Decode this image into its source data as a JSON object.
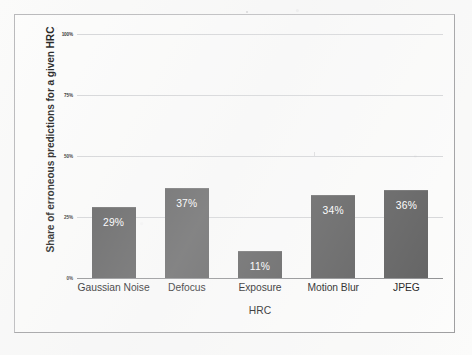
{
  "chart_data": {
    "type": "bar",
    "title": "",
    "subtitle": "",
    "xlabel": "HRC",
    "ylabel": "Share of erroneous predictions for a given HRC",
    "categories": [
      "Gaussian Noise",
      "Defocus",
      "Exposure",
      "Motion Blur",
      "JPEG"
    ],
    "values": [
      29,
      37,
      11,
      34,
      36
    ],
    "value_labels": [
      "29%",
      "37%",
      "11%",
      "34%",
      "36%"
    ],
    "ylim": [
      0,
      100
    ],
    "ytick_values": [
      0,
      25,
      50,
      75,
      100
    ],
    "ytick_labels": [
      "0%",
      "25%",
      "50%",
      "75%",
      "100%"
    ],
    "grid": true,
    "legend": false,
    "legend_position": "none",
    "bar_color": "#5c5c5c",
    "value_label_color": "#ffffff",
    "gridline_color": "#d5d6d8",
    "axis_color": "#8d8e90",
    "background_color": "#fdfdfc"
  }
}
